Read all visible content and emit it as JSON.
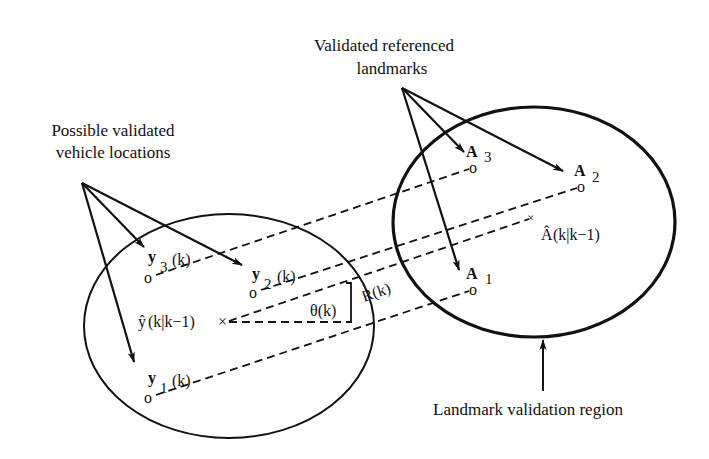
{
  "diagram": {
    "labels": {
      "vehicle_title_line1": "Possible validated",
      "vehicle_title_line2": "vehicle locations",
      "landmark_title_line1": "Validated referenced",
      "landmark_title_line2": "landmarks",
      "region_label": "Landmark validation region"
    },
    "vehicle_points": [
      {
        "symbol": "y",
        "sub": "3",
        "arg": "(k)"
      },
      {
        "symbol": "y",
        "sub": "2",
        "arg": "(k)"
      },
      {
        "symbol": "y",
        "sub": "1",
        "arg": "(k)"
      }
    ],
    "vehicle_estimate": {
      "symbol": "ŷ",
      "arg": "(k|k−1)"
    },
    "landmark_points": [
      {
        "symbol": "A",
        "sub": "3"
      },
      {
        "symbol": "A",
        "sub": "2"
      },
      {
        "symbol": "A",
        "sub": "1"
      }
    ],
    "landmark_estimate": {
      "symbol": "Â",
      "arg": "(k|k−1)"
    },
    "range_label": "R(k)",
    "bearing_label": "θ(k)",
    "marker_o": "o",
    "marker_x": "×"
  }
}
